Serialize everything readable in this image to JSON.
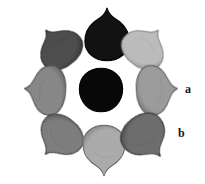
{
  "figure": {
    "kind": "specimen-plate",
    "background_color": "#ffffff",
    "width": 205,
    "height": 184
  },
  "labels": [
    {
      "id": "a",
      "text": "a",
      "x": 185,
      "y": 83
    },
    {
      "id": "b",
      "text": "b",
      "x": 178,
      "y": 127
    }
  ],
  "specimens": [
    {
      "id": "top-center",
      "position_name": "top-center",
      "shape": "teardrop-down",
      "fill": "#171717",
      "edge": "#0a0a0a",
      "tone_label": "very dark",
      "x": 84,
      "y": 6,
      "w": 46,
      "h": 56,
      "rotate": 0
    },
    {
      "id": "top-left",
      "position_name": "top-left",
      "shape": "teardrop-lower-left",
      "fill": "#4f4f4f",
      "edge": "#2e2e2e",
      "tone_label": "dark gray",
      "x": 35,
      "y": 24,
      "w": 47,
      "h": 45,
      "rotate": -38
    },
    {
      "id": "top-right",
      "position_name": "top-right",
      "shape": "teardrop-lower-right",
      "fill": "#b9b9b9",
      "edge": "#7e7e7e",
      "tone_label": "light gray",
      "x": 122,
      "y": 24,
      "w": 47,
      "h": 45,
      "rotate": 38
    },
    {
      "id": "middle-left",
      "position_name": "middle-left",
      "shape": "teardrop-right",
      "fill": "#878787",
      "edge": "#545454",
      "tone_label": "medium gray",
      "x": 19,
      "y": 68,
      "w": 52,
      "h": 44,
      "rotate": -86
    },
    {
      "id": "center",
      "position_name": "center",
      "shape": "round",
      "fill": "#0c0c0c",
      "edge": "#050505",
      "tone_label": "black",
      "x": 78,
      "y": 67,
      "w": 46,
      "h": 46,
      "rotate": 0
    },
    {
      "id": "middle-right",
      "position_name": "middle-right",
      "shape": "teardrop-left",
      "fill": "#9a9a9a",
      "edge": "#636363",
      "tone_label": "medium-light gray",
      "x": 131,
      "y": 68,
      "w": 52,
      "h": 44,
      "rotate": 86
    },
    {
      "id": "bottom-left",
      "position_name": "bottom-left",
      "shape": "teardrop-upper-left",
      "fill": "#7d7d7d",
      "edge": "#4a4a4a",
      "tone_label": "medium gray",
      "x": 35,
      "y": 115,
      "w": 48,
      "h": 46,
      "rotate": -140
    },
    {
      "id": "bottom-center",
      "position_name": "bottom-center",
      "shape": "teardrop-up",
      "fill": "#a9a9a9",
      "edge": "#707070",
      "tone_label": "light-medium gray",
      "x": 82,
      "y": 124,
      "w": 44,
      "h": 54,
      "rotate": 180
    },
    {
      "id": "bottom-right",
      "position_name": "bottom-right",
      "shape": "teardrop-upper-right",
      "fill": "#6e6e6e",
      "edge": "#3d3d3d",
      "tone_label": "dark-medium gray",
      "x": 122,
      "y": 113,
      "w": 48,
      "h": 50,
      "rotate": 142
    }
  ]
}
